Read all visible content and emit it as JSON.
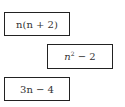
{
  "expressions": [
    {
      "id": "expr-1",
      "text": "n(n + 2)"
    },
    {
      "id": "expr-2",
      "text": "n^2 − 2",
      "base": "n",
      "exponent": "2",
      "rest": " − 2"
    },
    {
      "id": "expr-3",
      "text": "3n − 4"
    }
  ]
}
